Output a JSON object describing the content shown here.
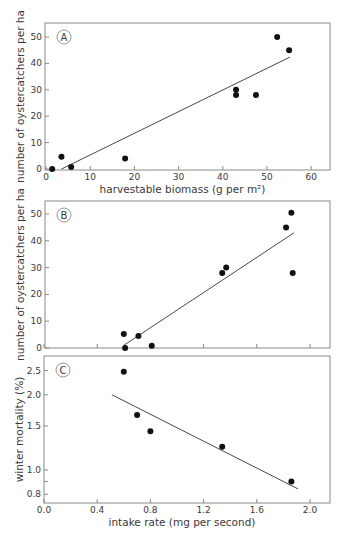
{
  "chart_data": [
    {
      "id": "A",
      "type": "scatter",
      "panel_label": "A",
      "title": "",
      "xlabel": "harvestable biomass (g per m²)",
      "ylabel": "number of oystercatchers per ha",
      "xlim": [
        0,
        64
      ],
      "ylim": [
        0,
        55
      ],
      "xticks": [
        0,
        10,
        20,
        30,
        40,
        50,
        60
      ],
      "xtick_labels": [
        "0",
        "10",
        "20",
        "30",
        "40",
        "50",
        "60"
      ],
      "yticks": [
        0,
        10,
        20,
        30,
        40,
        50
      ],
      "ytick_labels": [
        "0",
        "10",
        "20",
        "30",
        "40",
        "50"
      ],
      "grid": false,
      "x": [
        1.4,
        3.5,
        5.7,
        17.9,
        43,
        43,
        47.5,
        52.3,
        55
      ],
      "y": [
        0,
        4.6,
        0.8,
        4,
        30,
        28,
        28,
        50,
        45
      ],
      "fit_line": {
        "x": [
          3.5,
          55.2
        ],
        "y": [
          0,
          42.4
        ]
      },
      "frame_px": {
        "left": 45,
        "top": 23,
        "right": 330,
        "bottom": 170
      },
      "x_map": {
        "px0": 46,
        "scale": 4.42
      },
      "y_map": {
        "px0": 169,
        "scale": 2.64,
        "log": false
      }
    },
    {
      "id": "B",
      "type": "scatter",
      "panel_label": "B",
      "title": "",
      "xlabel": "",
      "ylabel": "number of oystercatchers per ha",
      "xlim": [
        0,
        2.15
      ],
      "ylim": [
        0,
        55
      ],
      "xticks": [
        0,
        0.4,
        0.8,
        1.2,
        1.6,
        2.0
      ],
      "xtick_labels": [],
      "yticks": [
        0,
        10,
        20,
        30,
        40,
        50
      ],
      "ytick_labels": [
        "0",
        "10",
        "20",
        "30",
        "40",
        "50"
      ],
      "grid": false,
      "x": [
        0.6,
        0.61,
        0.71,
        0.81,
        1.34,
        1.37,
        1.82,
        1.86,
        1.87
      ],
      "y": [
        5.2,
        0,
        4.5,
        0.8,
        28,
        30,
        45,
        50.5,
        28
      ],
      "fit_line": {
        "x": [
          0.6,
          1.88
        ],
        "y": [
          1,
          43
        ]
      },
      "frame_px": {
        "left": 45,
        "top": 201,
        "right": 330,
        "bottom": 348
      },
      "x_map": {
        "px0": 44,
        "scale": 133
      },
      "y_map": {
        "px0": 348,
        "scale": 2.68,
        "log": false
      }
    },
    {
      "id": "C",
      "type": "scatter",
      "panel_label": "C",
      "title": "",
      "xlabel": "intake rate (mg per second)",
      "ylabel": "winter mortality (%)",
      "xlim": [
        0,
        2.15
      ],
      "ylim": [
        0.74,
        2.7
      ],
      "yscale": "log",
      "xticks": [
        0,
        0.4,
        0.8,
        1.2,
        1.6,
        2.0
      ],
      "xtick_labels": [
        "0.0",
        "0.4",
        "0.8",
        "1.2",
        "1.6",
        "2.0"
      ],
      "yticks": [
        0.8,
        0.9,
        1.0,
        1.5,
        2.0,
        2.5
      ],
      "ytick_labels": [
        "0.8",
        "",
        "1.0",
        "1.5",
        "2.0",
        "2.5"
      ],
      "grid": false,
      "x": [
        0.6,
        0.7,
        0.8,
        1.34,
        1.86
      ],
      "y": [
        2.47,
        1.66,
        1.43,
        1.24,
        0.9
      ],
      "fit_line": {
        "x": [
          0.51,
          1.91
        ],
        "y": [
          2.0,
          0.84
        ]
      },
      "frame_px": {
        "left": 44,
        "top": 356,
        "right": 330,
        "bottom": 503
      },
      "x_map": {
        "px0": 44,
        "scale": 133
      },
      "y_map": {
        "px0": 470,
        "scale": 250,
        "log": true
      }
    }
  ]
}
